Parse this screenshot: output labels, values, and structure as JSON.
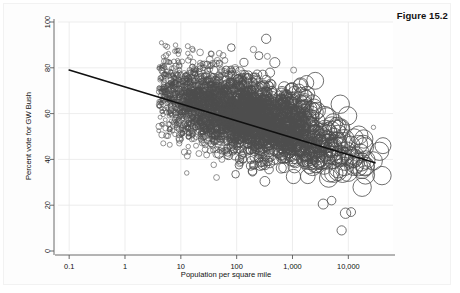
{
  "figure": {
    "label": "Figure 15.2"
  },
  "chart_data": {
    "type": "scatter",
    "title": "",
    "xlabel": "Population per square mile",
    "ylabel": "Percent vote for GW Bush",
    "xscale": "log",
    "yscale": "linear",
    "xlim": [
      0.0631,
      63100
    ],
    "ylim": [
      0,
      100
    ],
    "grid": true,
    "grid_axis": "both",
    "legend": null,
    "x_ticks": [
      0.1,
      1,
      10,
      100,
      1000,
      10000
    ],
    "x_tick_labels": [
      "0.1",
      "1",
      "10",
      "100",
      "1,000",
      "10,000"
    ],
    "y_ticks": [
      0,
      20,
      40,
      60,
      80,
      100
    ],
    "y_tick_labels": [
      "0",
      "20",
      "40",
      "60",
      "80",
      "100"
    ],
    "marker": "open-circle",
    "marker_color": "#4d4d4d",
    "marker_size_encodes": "population",
    "n_points": 3100,
    "fit_line": {
      "type": "linear-in-log10x",
      "color": "#101010",
      "x_start": 0.1,
      "x_end": 30000,
      "y_start": 79.0,
      "y_end": 38.5,
      "slope_per_decade": -6.4,
      "intercept_at_x1": 72.6
    },
    "series": [
      {
        "name": "US counties",
        "description": "Each circle is a county; radius grows with population; x = population per square mile (log), y = percent vote for GW Bush",
        "x_range_described": "0.2 to 60,000",
        "y_range_described": "8 to 93",
        "cloud_center_x": 80,
        "cloud_center_y": 62,
        "trend": "negative"
      }
    ],
    "annotations": []
  }
}
